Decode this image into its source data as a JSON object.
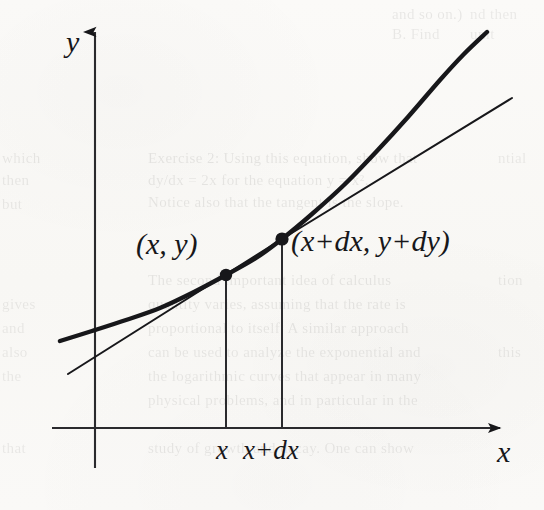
{
  "figure": {
    "kind": "calculus-tangent-diagram",
    "width": 544,
    "height": 510,
    "background_color": "#faf9f7",
    "ink_color": "#17171a"
  },
  "axes": {
    "y_axis_label": "y",
    "x_axis_label": "x",
    "y_axis_x": 95,
    "y_axis_top": 25,
    "y_axis_bottom": 468,
    "x_axis_y": 428,
    "x_axis_left": 52,
    "x_axis_right": 512,
    "arrowheads": "both-positive"
  },
  "labels": {
    "point_first": "(x, y)",
    "point_second": "(x+dx, y+dy)",
    "tick_first": "x",
    "tick_second": "x+dx"
  },
  "points": [
    {
      "name": "first-point",
      "label": "(x, y)",
      "px": 226,
      "py": 275
    },
    {
      "name": "second-point",
      "label": "(x+dx, y+dy)",
      "px": 282,
      "py": 239
    }
  ],
  "drop_lines": [
    {
      "name": "drop-line-x",
      "px": 226,
      "from_y": 275,
      "to_y": 428
    },
    {
      "name": "drop-line-x-plus-dx",
      "px": 282,
      "from_y": 239,
      "to_y": 428
    }
  ],
  "chart_data": {
    "type": "line",
    "title": "",
    "xlabel": "x",
    "ylabel": "y",
    "grid": false,
    "legend": null,
    "xlim": [
      52,
      512
    ],
    "ylim": [
      32,
      428
    ],
    "series": [
      {
        "name": "curve",
        "style": "thick-solid",
        "description": "convex increasing function y = f(x)",
        "points": [
          [
            60,
            341
          ],
          [
            92,
            331
          ],
          [
            126,
            320
          ],
          [
            160,
            308
          ],
          [
            194,
            292
          ],
          [
            226,
            275
          ],
          [
            256,
            258
          ],
          [
            282,
            239
          ],
          [
            312,
            214
          ],
          [
            344,
            185
          ],
          [
            376,
            152
          ],
          [
            408,
            117
          ],
          [
            440,
            80
          ],
          [
            464,
            54
          ],
          [
            487,
            32
          ]
        ]
      },
      {
        "name": "tangent-line",
        "style": "thin-solid",
        "description": "tangent to the curve at the second point (x+dx, y+dy)",
        "points": [
          [
            68,
            374
          ],
          [
            282,
            239
          ],
          [
            512,
            98
          ]
        ]
      }
    ],
    "markers": [
      {
        "name": "first-point",
        "x": 226,
        "y": 275,
        "label": "(x, y)"
      },
      {
        "name": "second-point",
        "x": 282,
        "y": 239,
        "label": "(x+dx, y+dy)"
      }
    ],
    "xticks": [
      {
        "pos": 226,
        "label": "x"
      },
      {
        "pos": 282,
        "label": "x+dx"
      }
    ],
    "yticks": []
  },
  "ghost_text": {
    "note": "faint show-through from the reverse side of the scanned page",
    "lines": [
      {
        "text": "and so on.)",
        "x": 392,
        "y": 6,
        "size": 15,
        "opacity": 0.075
      },
      {
        "text": "B. Find",
        "x": 392,
        "y": 26,
        "size": 15,
        "opacity": 0.07
      },
      {
        "text": "nd then",
        "x": 470,
        "y": 6,
        "size": 15,
        "opacity": 0.068
      },
      {
        "text": "unit",
        "x": 470,
        "y": 26,
        "size": 15,
        "opacity": 0.066
      },
      {
        "text": "which",
        "x": 2,
        "y": 150,
        "size": 15,
        "opacity": 0.072
      },
      {
        "text": "Exercise 2: Using this equation, show that",
        "x": 148,
        "y": 150,
        "size": 15,
        "opacity": 0.078
      },
      {
        "text": "dy/dx = 2x for the equation y = x².",
        "x": 148,
        "y": 172,
        "size": 15,
        "opacity": 0.076
      },
      {
        "text": "Notice also that the tangent is the slope.",
        "x": 148,
        "y": 194,
        "size": 15,
        "opacity": 0.074
      },
      {
        "text": "then",
        "x": 2,
        "y": 172,
        "size": 15,
        "opacity": 0.07
      },
      {
        "text": "The second important idea of calculus",
        "x": 148,
        "y": 272,
        "size": 15,
        "opacity": 0.076
      },
      {
        "text": "quantity varies, assuming that the rate is",
        "x": 148,
        "y": 296,
        "size": 15,
        "opacity": 0.074
      },
      {
        "text": "proportional to itself.  A similar approach",
        "x": 148,
        "y": 320,
        "size": 15,
        "opacity": 0.073
      },
      {
        "text": "can be used to analyze the exponential and",
        "x": 148,
        "y": 344,
        "size": 15,
        "opacity": 0.072
      },
      {
        "text": "the logarithmic curves that appear in many",
        "x": 148,
        "y": 368,
        "size": 15,
        "opacity": 0.071
      },
      {
        "text": "physical problems, and in particular in the",
        "x": 148,
        "y": 392,
        "size": 15,
        "opacity": 0.07
      },
      {
        "text": "study of growth and decay.  One can show",
        "x": 148,
        "y": 440,
        "size": 15,
        "opacity": 0.069
      },
      {
        "text": "but",
        "x": 2,
        "y": 196,
        "size": 15,
        "opacity": 0.068
      },
      {
        "text": "gives",
        "x": 2,
        "y": 296,
        "size": 15,
        "opacity": 0.068
      },
      {
        "text": "and",
        "x": 2,
        "y": 320,
        "size": 15,
        "opacity": 0.067
      },
      {
        "text": "also",
        "x": 2,
        "y": 344,
        "size": 15,
        "opacity": 0.067
      },
      {
        "text": "the",
        "x": 2,
        "y": 368,
        "size": 15,
        "opacity": 0.066
      },
      {
        "text": "that",
        "x": 2,
        "y": 440,
        "size": 15,
        "opacity": 0.066
      },
      {
        "text": "ntial",
        "x": 498,
        "y": 150,
        "size": 15,
        "opacity": 0.066
      },
      {
        "text": "tion",
        "x": 498,
        "y": 272,
        "size": 15,
        "opacity": 0.065
      },
      {
        "text": "this",
        "x": 498,
        "y": 344,
        "size": 15,
        "opacity": 0.065
      }
    ]
  }
}
